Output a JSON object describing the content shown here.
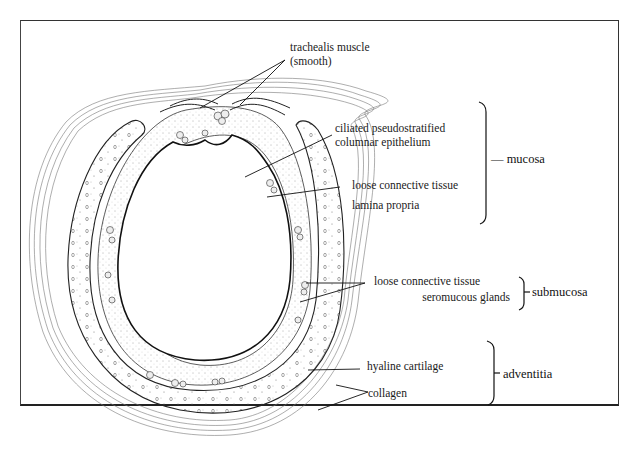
{
  "figure": {
    "labels": {
      "trachealis_line1": "trachealis muscle",
      "trachealis_line2": "(smooth)",
      "epithelium_line1": "ciliated pseudostratified",
      "epithelium_line2": "columnar epithelium",
      "lamina_line1": "loose connective tissue",
      "lamina_line2": "lamina propria",
      "submucosa_line1": "loose connective tissue",
      "submucosa_line2": "seromucous glands",
      "cartilage": "hyaline cartilage",
      "collagen": "collagen"
    },
    "groups": {
      "mucosa": "— mucosa",
      "submucosa": "submucosa",
      "adventitia": "adventitia"
    }
  }
}
